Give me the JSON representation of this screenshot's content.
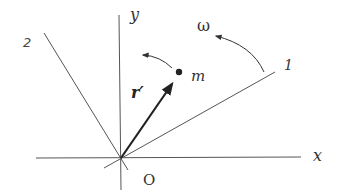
{
  "diagram": {
    "type": "rotating-frame-coordinate-diagram",
    "labels": {
      "x_axis": "x",
      "y_axis": "y",
      "axis_1": "1",
      "axis_2": "2",
      "origin": "O",
      "mass": "m",
      "position_vector": "r′",
      "angular_velocity": "ω"
    },
    "colors": {
      "line": "#555555",
      "vector": "#222222",
      "background": "#ffffff"
    }
  }
}
